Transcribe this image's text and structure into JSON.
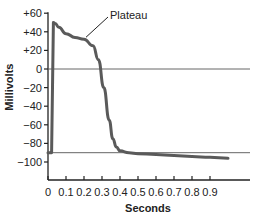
{
  "chart_data": {
    "type": "line",
    "title": "",
    "xlabel": "Seconds",
    "ylabel": "Millivolts",
    "xlim": [
      0,
      1.0
    ],
    "ylim": [
      -100,
      60
    ],
    "x_ticks": [
      0,
      0.1,
      0.2,
      0.3,
      0.4,
      0.5,
      0.6,
      0.7,
      0.8,
      0.9
    ],
    "x_tick_labels": [
      "0",
      "0.1",
      "0.2",
      "0.3",
      "0.4",
      "0.5",
      "0.6",
      "0.7",
      "0.8",
      "0.9"
    ],
    "y_ticks": [
      60,
      40,
      20,
      0,
      -20,
      -40,
      -60,
      -80,
      -100
    ],
    "y_tick_labels": [
      "+60",
      "+40",
      "+20",
      "0",
      "−20",
      "−40",
      "−60",
      "−80",
      "−100"
    ],
    "grid": false,
    "reference_lines": [
      {
        "y": 0,
        "label": "zero line"
      },
      {
        "y": -90,
        "label": "resting potential"
      }
    ],
    "annotations": [
      {
        "text": "Plateau",
        "x": 0.2,
        "y": 32
      }
    ],
    "series": [
      {
        "name": "Action potential",
        "x": [
          0,
          0.02,
          0.03,
          0.04,
          0.06,
          0.1,
          0.15,
          0.2,
          0.25,
          0.28,
          0.31,
          0.34,
          0.36,
          0.38,
          0.4,
          0.45,
          0.5,
          0.6,
          0.7,
          0.8,
          0.9,
          1.0
        ],
        "y": [
          -90,
          -90,
          50,
          49,
          45,
          38,
          34,
          32,
          25,
          10,
          -20,
          -55,
          -75,
          -84,
          -88,
          -90,
          -91,
          -92,
          -93,
          -94,
          -95,
          -96
        ]
      }
    ]
  }
}
